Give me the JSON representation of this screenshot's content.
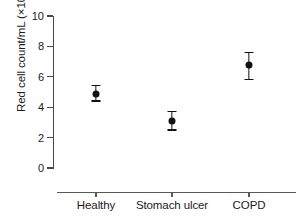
{
  "chart_data": {
    "type": "scatter",
    "title": "",
    "xlabel": "",
    "ylabel": "Red cell count/mL (×10⁹)",
    "ylabel_text": "Red cell count/mL (×10",
    "ylabel_exponent": "9",
    "ylabel_suffix": ")",
    "categories": [
      "Healthy",
      "Stomach ulcer",
      "COPD"
    ],
    "values": [
      4.85,
      3.1,
      6.8
    ],
    "error_low": [
      4.45,
      2.55,
      5.85
    ],
    "error_high": [
      5.45,
      3.75,
      7.65
    ],
    "ylim": [
      0,
      10
    ],
    "yticks": [
      0,
      2,
      4,
      6,
      8,
      10
    ],
    "ytick_labels": [
      "0",
      "2",
      "4",
      "6",
      "8",
      "10"
    ],
    "grid": false,
    "legend": false,
    "marker_color": "#111111",
    "axis_color": "#4a4a4a",
    "background_color": "#ffffff"
  },
  "axes": {
    "y_label": "Red cell count/mL (×10⁹)",
    "y_tick_labels": [
      "10",
      "8",
      "6",
      "4",
      "2",
      "0"
    ],
    "x_tick_labels": [
      "Healthy",
      "Stomach ulcer",
      "COPD"
    ]
  }
}
